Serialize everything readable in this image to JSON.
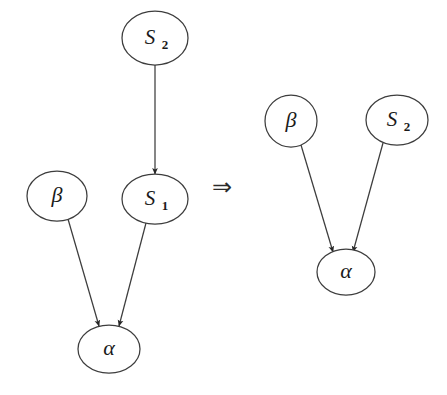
{
  "diagram": {
    "background_color": "#ffffff",
    "stroke_color": "#3d3d3d",
    "label_color": "#1a1a1a",
    "arrow_fill": "#262626",
    "operator": {
      "symbol": "⇒",
      "name": "implies",
      "x": 222,
      "y": 188
    },
    "left_graph": {
      "name": "before",
      "nodes": [
        {
          "id": "S2",
          "label_main": "S",
          "label_sub": "2",
          "cx": 155,
          "cy": 38,
          "rx": 33,
          "ry": 27
        },
        {
          "id": "S1",
          "label_main": "S",
          "label_sub": "1",
          "cx": 155,
          "cy": 199,
          "rx": 33,
          "ry": 25
        },
        {
          "id": "beta",
          "label_main": "β",
          "label_sub": "",
          "cx": 57,
          "cy": 196,
          "rx": 30,
          "ry": 25
        },
        {
          "id": "alpha",
          "label_main": "α",
          "label_sub": "",
          "cx": 109,
          "cy": 349,
          "rx": 31,
          "ry": 24
        }
      ],
      "edges": [
        {
          "from": "S2",
          "to": "S1",
          "x1": 155,
          "y1": 65,
          "x2": 155,
          "y2": 172
        },
        {
          "from": "beta",
          "to": "alpha",
          "x1": 68,
          "y1": 219,
          "x2": 99,
          "y2": 324
        },
        {
          "from": "S1",
          "to": "alpha",
          "x1": 146,
          "y1": 223,
          "x2": 119,
          "y2": 324
        }
      ]
    },
    "right_graph": {
      "name": "after",
      "nodes": [
        {
          "id": "beta",
          "label_main": "β",
          "label_sub": "",
          "cx": 291,
          "cy": 121,
          "rx": 26,
          "ry": 26
        },
        {
          "id": "S2",
          "label_main": "S",
          "label_sub": "2",
          "cx": 397,
          "cy": 120,
          "rx": 31,
          "ry": 25
        },
        {
          "id": "alpha",
          "label_main": "α",
          "label_sub": "",
          "cx": 346,
          "cy": 272,
          "rx": 29,
          "ry": 23
        }
      ],
      "edges": [
        {
          "from": "beta",
          "to": "alpha",
          "x1": 301,
          "y1": 145,
          "x2": 333,
          "y2": 250
        },
        {
          "from": "S2",
          "to": "alpha",
          "x1": 383,
          "y1": 143,
          "x2": 353,
          "y2": 250
        }
      ]
    }
  }
}
